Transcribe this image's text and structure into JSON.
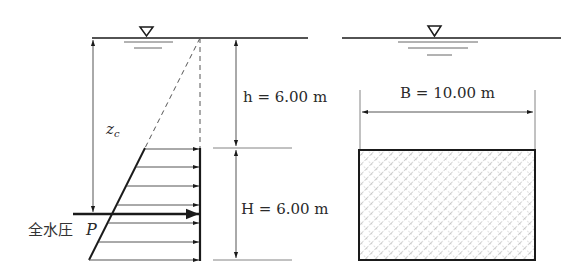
{
  "diagram": {
    "left": {
      "water_surface_symbol": "▽",
      "depth_label_h": "h = 6.00 m",
      "height_label_H": "H = 6.00 m",
      "centroid_label": "z",
      "centroid_subscript": "c",
      "resultant_label_jp": "全水圧",
      "resultant_symbol": "P",
      "pressure_arrow_count": 7
    },
    "right": {
      "water_surface_symbol": "▽",
      "width_label_B": "B = 10.00 m",
      "plate_fill": "crosshatch"
    },
    "colors": {
      "line": "#1a1a1a",
      "thin_line": "#555555",
      "hatch": "#8a8a8a",
      "background": "#ffffff"
    }
  }
}
